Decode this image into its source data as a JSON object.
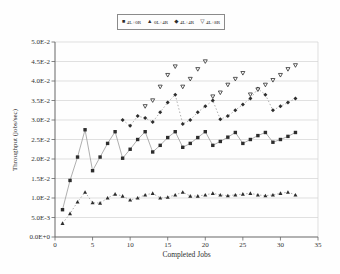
{
  "figure": {
    "type_note": "scanned grayscale journal figure, no title shown"
  },
  "chart_data": {
    "type": "scatter",
    "title": "",
    "xlabel": "Completed Jobs",
    "ylabel": "Throughput (jobs/sec)",
    "xlim": [
      0,
      35
    ],
    "ylim": [
      0,
      0.05
    ],
    "x_ticks": [
      0,
      5,
      10,
      15,
      20,
      25,
      30,
      35
    ],
    "y_ticks": [
      {
        "value": 0.0,
        "label": "0.0E+0"
      },
      {
        "value": 0.005,
        "label": "5.0E-3"
      },
      {
        "value": 0.01,
        "label": "1.0E-2"
      },
      {
        "value": 0.015,
        "label": "1.5E-2"
      },
      {
        "value": 0.02,
        "label": "2.0E-2"
      },
      {
        "value": 0.025,
        "label": "2.5E-2"
      },
      {
        "value": 0.03,
        "label": "3.0E-2"
      },
      {
        "value": 0.035,
        "label": "3.5E-2"
      },
      {
        "value": 0.04,
        "label": "4.0E-2"
      },
      {
        "value": 0.045,
        "label": "4.5E-2"
      },
      {
        "value": 0.05,
        "label": "5.0E-2"
      }
    ],
    "grid": "horizontal",
    "legend_position": "top-center",
    "colors": {
      "marker": "#2d2d2d",
      "line": "#9a9a9a",
      "grid": "#d2d2d2",
      "axis": "#666666",
      "text": "#333333"
    },
    "series": [
      {
        "name": "4L+0R",
        "marker": "square",
        "line": "solid",
        "x": [
          1,
          2,
          3,
          4,
          5,
          6,
          7,
          8,
          9,
          10,
          11,
          12,
          13,
          14,
          15,
          16,
          17,
          18,
          19,
          20,
          21,
          22,
          23,
          24,
          25,
          26,
          27,
          28,
          29,
          30,
          31,
          32
        ],
        "y": [
          0.007,
          0.0145,
          0.0205,
          0.0275,
          0.017,
          0.0205,
          0.024,
          0.027,
          0.0202,
          0.0225,
          0.025,
          0.027,
          0.0218,
          0.0235,
          0.0255,
          0.027,
          0.023,
          0.024,
          0.0255,
          0.027,
          0.0235,
          0.0245,
          0.0256,
          0.0268,
          0.024,
          0.025,
          0.026,
          0.0268,
          0.0243,
          0.025,
          0.0258,
          0.0268
        ]
      },
      {
        "name": "0L+4R",
        "marker": "triangle",
        "line": "dotted",
        "x": [
          1,
          2,
          3,
          4,
          5,
          6,
          7,
          8,
          9,
          10,
          11,
          12,
          13,
          14,
          15,
          16,
          17,
          18,
          19,
          20,
          21,
          22,
          23,
          24,
          25,
          26,
          27,
          28,
          29,
          30,
          31,
          32
        ],
        "y": [
          0.0035,
          0.006,
          0.009,
          0.0115,
          0.0088,
          0.0087,
          0.01,
          0.011,
          0.0105,
          0.0095,
          0.01,
          0.0108,
          0.0112,
          0.01,
          0.0102,
          0.0108,
          0.0115,
          0.0105,
          0.0105,
          0.0108,
          0.0112,
          0.0108,
          0.0106,
          0.0108,
          0.011,
          0.0112,
          0.0108,
          0.0106,
          0.0108,
          0.0112,
          0.0115,
          0.0108
        ]
      },
      {
        "name": "4L+4R",
        "marker": "diamond",
        "line": "dotted",
        "x": [
          9,
          10,
          11,
          12,
          13,
          14,
          15,
          16,
          17,
          18,
          19,
          20,
          21,
          22,
          23,
          24,
          25,
          26,
          27,
          28,
          29,
          30,
          31,
          32
        ],
        "y": [
          0.03,
          0.0285,
          0.031,
          0.0305,
          0.0295,
          0.032,
          0.0345,
          0.0365,
          0.029,
          0.03,
          0.032,
          0.0335,
          0.035,
          0.0302,
          0.031,
          0.0325,
          0.034,
          0.0355,
          0.038,
          0.0365,
          0.0325,
          0.0335,
          0.0345,
          0.0355
        ]
      },
      {
        "name": "4L+8R",
        "marker": "triangle-down-open",
        "line": "none",
        "x": [
          12,
          13,
          14,
          15,
          16,
          17,
          18,
          19,
          20,
          21,
          22,
          23,
          24,
          25,
          26,
          27,
          28,
          29,
          30,
          31,
          32
        ],
        "y": [
          0.0335,
          0.035,
          0.0385,
          0.0415,
          0.0437,
          0.0385,
          0.0405,
          0.043,
          0.045,
          0.036,
          0.037,
          0.039,
          0.0405,
          0.042,
          0.0365,
          0.0378,
          0.039,
          0.0402,
          0.0415,
          0.043,
          0.044
        ]
      }
    ]
  }
}
